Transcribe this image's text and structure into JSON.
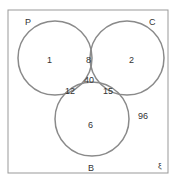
{
  "diagram": {
    "type": "venn",
    "universal_symbol": "ξ",
    "outside_value": "96",
    "sets": [
      {
        "name": "P",
        "label": "P"
      },
      {
        "name": "C",
        "label": "C"
      },
      {
        "name": "B",
        "label": "B"
      }
    ],
    "regions": {
      "P_only": "1",
      "C_only": "2",
      "B_only": "6",
      "P_C": "8",
      "P_B": "12",
      "C_B": "15",
      "P_C_B": "40"
    },
    "colors": {
      "circle": "#8a8a8a",
      "border": "#888888",
      "text": "#333333"
    }
  }
}
